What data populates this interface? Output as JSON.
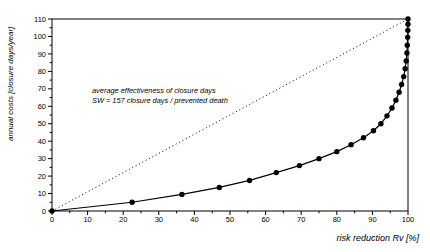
{
  "colors": {
    "background": "#ffffff",
    "foreground": "#000000"
  },
  "chart_data": {
    "type": "line",
    "title": "",
    "xlabel": "risk reduction Rv [%]",
    "ylabel": "annual costs [closure days/year]",
    "xlim": [
      0,
      100
    ],
    "ylim": [
      0,
      110
    ],
    "x_major_tick": 10,
    "x_minor_tick": 5,
    "y_major_tick": 10,
    "y_minor_tick": 5,
    "x_tick_labels": [
      0,
      10,
      20,
      30,
      40,
      50,
      60,
      70,
      80,
      90,
      100
    ],
    "y_tick_labels": [
      0,
      10,
      20,
      30,
      40,
      50,
      60,
      70,
      80,
      90,
      100,
      110
    ],
    "grid": false,
    "legend": "none",
    "annotation": {
      "line1": "average effectiveness of closure days",
      "line2": "SW = 157 closure days / prevented death"
    },
    "series": [
      {
        "name": "marginal cost curve of closure days",
        "style": "solid-with-markers",
        "color": "#000000",
        "points": [
          [
            0,
            0
          ],
          [
            22.5,
            5
          ],
          [
            36.5,
            9.5
          ],
          [
            47,
            13.5
          ],
          [
            55.5,
            17.5
          ],
          [
            63,
            22
          ],
          [
            69.5,
            26
          ],
          [
            75,
            30
          ],
          [
            80,
            34
          ],
          [
            84,
            38
          ],
          [
            87.5,
            42
          ],
          [
            90.3,
            46
          ],
          [
            92.4,
            50
          ],
          [
            94.1,
            54.5
          ],
          [
            95.5,
            59
          ],
          [
            96.6,
            63.5
          ],
          [
            97.5,
            68
          ],
          [
            98.2,
            72.5
          ],
          [
            98.8,
            77
          ],
          [
            99.2,
            81.5
          ],
          [
            99.5,
            86
          ],
          [
            99.7,
            90.5
          ],
          [
            99.8,
            95
          ],
          [
            99.9,
            99.5
          ],
          [
            99.95,
            103.5
          ],
          [
            100,
            107
          ],
          [
            100,
            110
          ]
        ]
      },
      {
        "name": "average effectiveness line",
        "style": "dotted",
        "color": "#000000",
        "points": [
          [
            0,
            0
          ],
          [
            100,
            110
          ]
        ]
      }
    ]
  }
}
